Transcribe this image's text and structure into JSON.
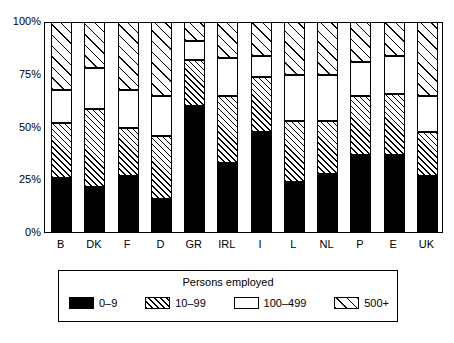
{
  "chart_data": {
    "type": "bar",
    "subtype": "stacked-percentage",
    "title": "",
    "xlabel": "",
    "ylabel": "",
    "ylim": [
      0,
      100
    ],
    "yticks": [
      0,
      25,
      50,
      75,
      100
    ],
    "ytick_labels": [
      "0%",
      "25%",
      "50%",
      "75%",
      "100%"
    ],
    "grid": false,
    "legend_position": "bottom",
    "legend_title": "Persons employed",
    "categories": [
      "B",
      "DK",
      "F",
      "D",
      "GR",
      "IRL",
      "I",
      "L",
      "NL",
      "P",
      "E",
      "UK"
    ],
    "series": [
      {
        "name": "0–9",
        "pattern": "solid-black",
        "color": "#000000",
        "values": [
          26,
          22,
          27,
          16,
          60,
          33,
          48,
          24,
          28,
          37,
          37,
          27
        ]
      },
      {
        "name": "10–99",
        "pattern": "dense-hatch",
        "color": "#ffffff",
        "values": [
          26,
          37,
          23,
          30,
          22,
          32,
          26,
          29,
          25,
          28,
          29,
          21
        ]
      },
      {
        "name": "100–499",
        "pattern": "white",
        "color": "#ffffff",
        "values": [
          16,
          19,
          18,
          19,
          9,
          18,
          10,
          22,
          22,
          16,
          18,
          17
        ]
      },
      {
        "name": "500+",
        "pattern": "sparse-hatch",
        "color": "#ffffff",
        "values": [
          32,
          22,
          32,
          35,
          9,
          17,
          16,
          25,
          25,
          19,
          16,
          35
        ]
      }
    ],
    "cumulative_tops": {
      "0–9": [
        26,
        22,
        27,
        16,
        60,
        33,
        48,
        24,
        28,
        37,
        37,
        27
      ],
      "10–99": [
        52,
        59,
        50,
        46,
        82,
        65,
        74,
        53,
        53,
        65,
        66,
        48
      ],
      "100–499": [
        68,
        78,
        68,
        65,
        91,
        83,
        84,
        75,
        75,
        81,
        84,
        65
      ],
      "500+": [
        100,
        100,
        100,
        100,
        100,
        100,
        100,
        100,
        100,
        100,
        100,
        100
      ]
    }
  },
  "legend": {
    "title": "Persons employed",
    "items": [
      {
        "label": "0–9",
        "swatch": "legend-swatch-black"
      },
      {
        "label": "10–99",
        "swatch": "legend-swatch-dense-hatch"
      },
      {
        "label": "100–499",
        "swatch": "legend-swatch-white"
      },
      {
        "label": "500+",
        "swatch": "legend-swatch-sparse-hatch"
      }
    ]
  }
}
